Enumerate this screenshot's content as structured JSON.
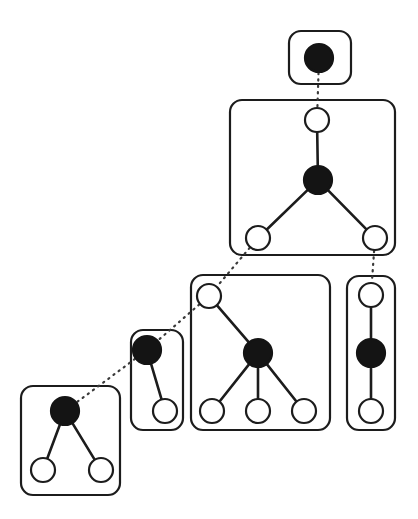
{
  "figure": {
    "type": "node-link-diagram",
    "title": "",
    "background_color": "#ffffff",
    "width": 418,
    "height": 519,
    "palette": {
      "stroke": "#1c1c1c",
      "filled_node": "#141414",
      "open_node_fill": "#ffffff",
      "box_stroke": "#1c1c1c",
      "dotted_link": "#3a3a3a"
    },
    "legend": {
      "filled_node_meaning": "root / anchor node",
      "open_node_meaning": "child node",
      "dotted_link_meaning": "cross-box correspondence",
      "solid_link_meaning": "intra-box tree edge",
      "box_meaning": "grouping container"
    }
  },
  "boxes": [
    {
      "id": "box-1",
      "label": "box-1",
      "x": 289,
      "y": 31,
      "width": 62,
      "height": 53,
      "rx": 12,
      "node_count": 1
    },
    {
      "id": "box-2",
      "label": "box-2",
      "x": 230,
      "y": 100,
      "width": 165,
      "height": 155,
      "rx": 12,
      "node_count": 4
    },
    {
      "id": "box-3",
      "label": "box-3",
      "x": 191,
      "y": 275,
      "width": 139,
      "height": 155,
      "rx": 12,
      "node_count": 5
    },
    {
      "id": "box-4",
      "label": "box-4",
      "x": 131,
      "y": 330,
      "width": 52,
      "height": 100,
      "rx": 12,
      "node_count": 2
    },
    {
      "id": "box-5",
      "label": "box-5",
      "x": 21,
      "y": 386,
      "width": 99,
      "height": 109,
      "rx": 12,
      "node_count": 3
    },
    {
      "id": "box-6",
      "label": "box-6",
      "x": 347,
      "y": 276,
      "width": 48,
      "height": 154,
      "rx": 12,
      "node_count": 3
    }
  ],
  "nodes": [
    {
      "id": "n1-root",
      "box": "box-1",
      "cx": 319,
      "cy": 58,
      "r": 14,
      "style": "filled"
    },
    {
      "id": "n2-top",
      "box": "box-2",
      "cx": 317,
      "cy": 120,
      "r": 12,
      "style": "open"
    },
    {
      "id": "n2-mid",
      "box": "box-2",
      "cx": 318,
      "cy": 180,
      "r": 14,
      "style": "filled"
    },
    {
      "id": "n2-bl",
      "box": "box-2",
      "cx": 258,
      "cy": 238,
      "r": 12,
      "style": "open"
    },
    {
      "id": "n2-br",
      "box": "box-2",
      "cx": 375,
      "cy": 238,
      "r": 12,
      "style": "open"
    },
    {
      "id": "n3-top",
      "box": "box-3",
      "cx": 209,
      "cy": 296,
      "r": 12,
      "style": "open"
    },
    {
      "id": "n3-mid",
      "box": "box-3",
      "cx": 258,
      "cy": 353,
      "r": 14,
      "style": "filled"
    },
    {
      "id": "n3-b1",
      "box": "box-3",
      "cx": 212,
      "cy": 411,
      "r": 12,
      "style": "open"
    },
    {
      "id": "n3-b2",
      "box": "box-3",
      "cx": 258,
      "cy": 411,
      "r": 12,
      "style": "open"
    },
    {
      "id": "n3-b3",
      "box": "box-3",
      "cx": 304,
      "cy": 411,
      "r": 12,
      "style": "open"
    },
    {
      "id": "n4-top",
      "box": "box-4",
      "cx": 147,
      "cy": 350,
      "r": 14,
      "style": "filled"
    },
    {
      "id": "n4-bot",
      "box": "box-4",
      "cx": 165,
      "cy": 411,
      "r": 12,
      "style": "open"
    },
    {
      "id": "n5-root",
      "box": "box-5",
      "cx": 65,
      "cy": 411,
      "r": 14,
      "style": "filled"
    },
    {
      "id": "n5-bl",
      "box": "box-5",
      "cx": 43,
      "cy": 470,
      "r": 12,
      "style": "open"
    },
    {
      "id": "n5-br",
      "box": "box-5",
      "cx": 101,
      "cy": 470,
      "r": 12,
      "style": "open"
    },
    {
      "id": "n6-top",
      "box": "box-6",
      "cx": 371,
      "cy": 295,
      "r": 12,
      "style": "open"
    },
    {
      "id": "n6-mid",
      "box": "box-6",
      "cx": 371,
      "cy": 353,
      "r": 14,
      "style": "filled"
    },
    {
      "id": "n6-bot",
      "box": "box-6",
      "cx": 371,
      "cy": 411,
      "r": 12,
      "style": "open"
    }
  ],
  "edges_solid": [
    {
      "from": "n2-top",
      "to": "n2-mid"
    },
    {
      "from": "n2-mid",
      "to": "n2-bl"
    },
    {
      "from": "n2-mid",
      "to": "n2-br"
    },
    {
      "from": "n3-top",
      "to": "n3-mid"
    },
    {
      "from": "n3-mid",
      "to": "n3-b1"
    },
    {
      "from": "n3-mid",
      "to": "n3-b2"
    },
    {
      "from": "n3-mid",
      "to": "n3-b3"
    },
    {
      "from": "n4-top",
      "to": "n4-bot"
    },
    {
      "from": "n5-root",
      "to": "n5-bl"
    },
    {
      "from": "n5-root",
      "to": "n5-br"
    },
    {
      "from": "n6-top",
      "to": "n6-mid"
    },
    {
      "from": "n6-mid",
      "to": "n6-bot"
    }
  ],
  "edges_dotted": [
    {
      "from": "n1-root",
      "to": "n2-top"
    },
    {
      "from": "n2-bl",
      "to": "n3-top"
    },
    {
      "from": "n2-br",
      "to": "n6-top"
    },
    {
      "from": "n3-top",
      "to": "n4-top"
    },
    {
      "from": "n4-top",
      "to": "n5-root"
    }
  ]
}
